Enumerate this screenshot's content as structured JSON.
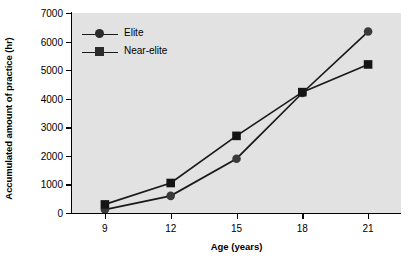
{
  "chart_data": {
    "type": "line",
    "title": "",
    "xlabel": "Age (years)",
    "ylabel": "Accumulated amount of practice (hr)",
    "x": [
      9,
      12,
      15,
      18,
      21
    ],
    "xtick_labels": [
      "9",
      "12",
      "15",
      "18",
      "21"
    ],
    "ytick_labels": [
      "0",
      "1000",
      "2000",
      "3000",
      "4000",
      "5000",
      "6000",
      "7000"
    ],
    "ytick_values": [
      0,
      1000,
      2000,
      3000,
      4000,
      5000,
      6000,
      7000
    ],
    "xlim": [
      7.5,
      22.5
    ],
    "ylim": [
      0,
      7000
    ],
    "grid": false,
    "legend_position": "upper left",
    "plot_background": "#e2e2e2",
    "line_color": "#1a1a1a",
    "series": [
      {
        "name": "Elite",
        "marker": "circle",
        "values": [
          120,
          600,
          1900,
          4200,
          6350
        ]
      },
      {
        "name": "Near-elite",
        "marker": "square",
        "values": [
          300,
          1050,
          2700,
          4230,
          5200
        ]
      }
    ]
  }
}
